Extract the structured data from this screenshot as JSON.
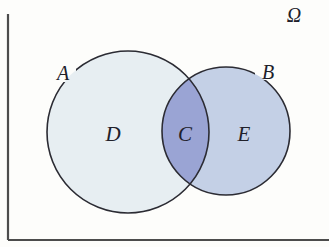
{
  "figure": {
    "type": "venn-diagram",
    "background_color": "#fdfdfb"
  },
  "universe": {
    "label": "Ω",
    "name": "omega",
    "border_color": "#4c4c4c"
  },
  "sets": [
    {
      "id": "A",
      "label": "A",
      "fill_color": "#e7eef2",
      "stroke_color": "#2b2b33"
    },
    {
      "id": "B",
      "label": "B",
      "fill_color": "#c4d0e6",
      "stroke_color": "#2b2b33"
    }
  ],
  "regions": [
    {
      "id": "D",
      "label": "D",
      "fill_color": "#e7eef2"
    },
    {
      "id": "C",
      "label": "C",
      "fill_color": "#9aa4d4"
    },
    {
      "id": "E",
      "label": "E",
      "fill_color": "#c4d0e6"
    }
  ]
}
